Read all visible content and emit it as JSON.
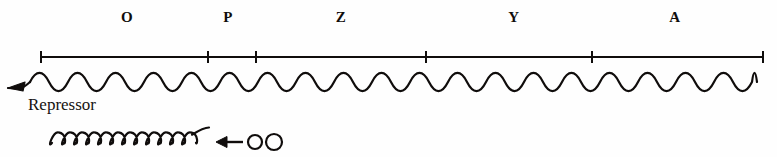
{
  "figure": {
    "title": "",
    "background_color": "#fefefe",
    "ink_color": "#100d0c",
    "width": 777,
    "height": 157
  },
  "gene_map": {
    "name": "lac-operon-style gene map",
    "axis": {
      "name": "gene-map-ruler",
      "y": 57,
      "x_start": 41,
      "x_end": 763,
      "tick_half_height": 6,
      "tick_positions": [
        41,
        208,
        256,
        426,
        592,
        763
      ]
    },
    "labels": [
      {
        "text": "O",
        "x": 127,
        "y": 10
      },
      {
        "text": "P",
        "x": 228,
        "y": 10
      },
      {
        "text": "Z",
        "x": 341,
        "y": 10
      },
      {
        "text": "Y",
        "x": 514,
        "y": 10
      },
      {
        "text": "A",
        "x": 675,
        "y": 10
      }
    ]
  },
  "dna_strand": {
    "name": "wavy-dna-strand",
    "center_y": 82,
    "amplitude": 9,
    "period": 38,
    "x_start": 30,
    "x_end": 757,
    "stroke_width": 2.2,
    "arrow": {
      "name": "strand-direction-arrow",
      "direction": "left",
      "tip_x": 8,
      "tip_y": 88
    }
  },
  "repressor": {
    "name": "repressor-annotation",
    "label": "Repressor",
    "label_x": 28,
    "label_y": 96,
    "coil": {
      "name": "repressor-protein-coil",
      "x_start": 52,
      "x_end": 196,
      "center_y": 141,
      "loop_count": 12,
      "loop_width": 12,
      "loop_height": 18,
      "stroke_width": 2.2
    },
    "binding_arrow": {
      "name": "inducer-binding-arrow",
      "direction": "left",
      "tip_x": 216,
      "tail_x": 243,
      "y": 142
    },
    "inducer_molecules": [
      {
        "name": "inducer-circle",
        "cx": 255,
        "cy": 142,
        "r": 7
      },
      {
        "name": "inducer-circle",
        "cx": 274,
        "cy": 142,
        "r": 8
      }
    ]
  }
}
